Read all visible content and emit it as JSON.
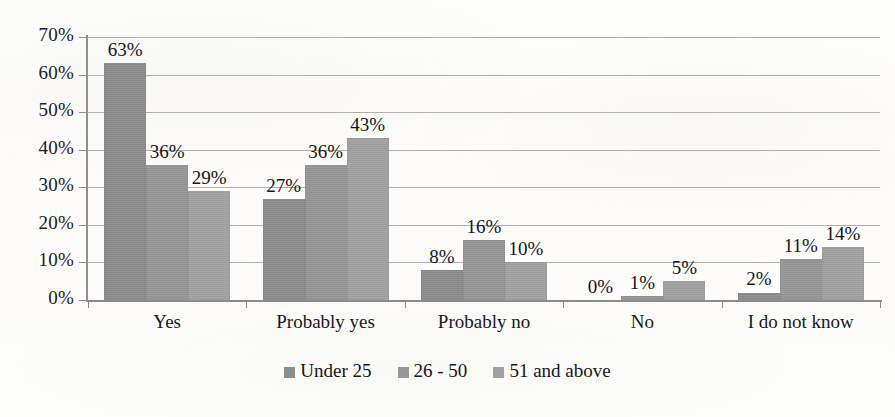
{
  "chart_data": {
    "type": "bar",
    "title": "",
    "subtitle": "",
    "xlabel": "",
    "ylabel": "",
    "categories": [
      "Yes",
      "Probably yes",
      "Probably no",
      "No",
      "I do not know"
    ],
    "series": [
      {
        "name": "Under 25",
        "values": [
          63,
          27,
          8,
          0,
          2
        ],
        "color": "#8d8d8d"
      },
      {
        "name": "26 - 50",
        "values": [
          36,
          36,
          16,
          1,
          11
        ],
        "color": "#979797"
      },
      {
        "name": "51 and above",
        "values": [
          29,
          43,
          10,
          5,
          14
        ],
        "color": "#a1a1a1"
      }
    ],
    "data_labels": [
      [
        "63%",
        "27%",
        "8%",
        "0%",
        "2%"
      ],
      [
        "36%",
        "36%",
        "16%",
        "1%",
        "11%"
      ],
      [
        "29%",
        "43%",
        "10%",
        "5%",
        "14%"
      ]
    ],
    "ylim": [
      0,
      70
    ],
    "ytick_labels": [
      "0%",
      "10%",
      "20%",
      "30%",
      "40%",
      "50%",
      "60%",
      "70%"
    ],
    "ytick_values": [
      0,
      10,
      20,
      30,
      40,
      50,
      60,
      70
    ],
    "grid": true,
    "legend_position": "bottom",
    "value_suffix": "%"
  }
}
